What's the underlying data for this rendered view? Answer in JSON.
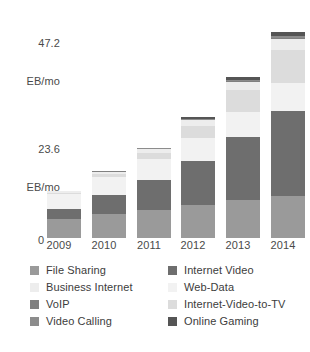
{
  "axis": {
    "y_top_value": "47.2",
    "y_top_unit": "EB/mo",
    "y_mid_value": "23.6",
    "y_mid_unit": "EB/mo",
    "y_zero": "0"
  },
  "legend": {
    "columns": [
      {
        "items": [
          {
            "label": "File Sharing",
            "color": "#9a9a9a"
          },
          {
            "label": "Business Internet",
            "color": "#ededed"
          },
          {
            "label": "VoIP",
            "color": "#808080"
          },
          {
            "label": "Video Calling",
            "color": "#8c8c8c"
          }
        ]
      },
      {
        "items": [
          {
            "label": "Internet Video",
            "color": "#6e6e6e"
          },
          {
            "label": "Web-Data",
            "color": "#f2f2f2"
          },
          {
            "label": "Internet-Video-to-TV",
            "color": "#dcdcdc"
          },
          {
            "label": "Online Gaming",
            "color": "#555555"
          }
        ]
      }
    ]
  },
  "chart_data": {
    "type": "bar",
    "stacked": true,
    "title": "",
    "xlabel": "",
    "ylabel": "EB/mo",
    "ylim": [
      0,
      47.2
    ],
    "grid": false,
    "legend_position": "bottom",
    "categories": [
      "2009",
      "2010",
      "2011",
      "2012",
      "2013",
      "2014"
    ],
    "series": [
      {
        "name": "File Sharing",
        "color": "#9a9a9a",
        "values": [
          4.1,
          5.0,
          6.0,
          7.0,
          8.0,
          9.0
        ]
      },
      {
        "name": "Internet Video",
        "color": "#6e6e6e",
        "values": [
          2.0,
          4.1,
          6.4,
          9.4,
          13.4,
          18.0
        ]
      },
      {
        "name": "Web-Data",
        "color": "#f2f2f2",
        "values": [
          3.3,
          3.8,
          4.3,
          4.9,
          5.4,
          6.0
        ]
      },
      {
        "name": "Internet-Video-to-TV",
        "color": "#dcdcdc",
        "values": [
          0.2,
          0.7,
          1.4,
          2.6,
          4.6,
          7.0
        ]
      },
      {
        "name": "Business Internet",
        "color": "#ededed",
        "values": [
          0.3,
          0.5,
          0.8,
          1.2,
          1.8,
          2.4
        ]
      },
      {
        "name": "VoIP",
        "color": "#808080",
        "values": [
          0.05,
          0.06,
          0.07,
          0.08,
          0.09,
          0.1
        ]
      },
      {
        "name": "Video Calling",
        "color": "#8c8c8c",
        "values": [
          0.02,
          0.04,
          0.08,
          0.15,
          0.3,
          0.5
        ]
      },
      {
        "name": "Online Gaming",
        "color": "#555555",
        "values": [
          0.05,
          0.1,
          0.2,
          0.35,
          0.6,
          0.9
        ]
      }
    ],
    "totals": [
      10.0,
      14.3,
      19.3,
      25.7,
      34.2,
      43.9
    ]
  }
}
